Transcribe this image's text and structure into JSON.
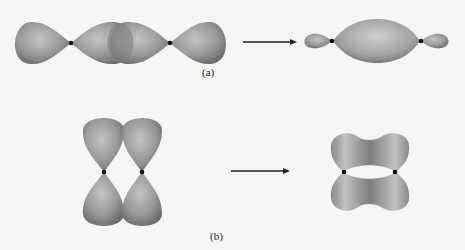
{
  "diagram": {
    "colors": {
      "background": "#f6f6f4",
      "lobe_light": "#b4b4b4",
      "lobe_dark": "#6e6e6e",
      "nucleus": "#111111",
      "arrow": "#222222"
    },
    "panels": [
      {
        "id": "a",
        "label": "(a)",
        "description": "Head-on overlap of two p orbitals along the internuclear axis forming a sigma bond",
        "before": "two p orbitals overlapping end-to-end",
        "after": "sigma bonding orbital with small back lobes"
      },
      {
        "id": "b",
        "label": "(b)",
        "description": "Side-by-side overlap of two parallel p orbitals forming a pi bond",
        "before": "two parallel p orbitals side by side",
        "after": "pi bonding orbital with electron density above and below the axis"
      }
    ]
  }
}
